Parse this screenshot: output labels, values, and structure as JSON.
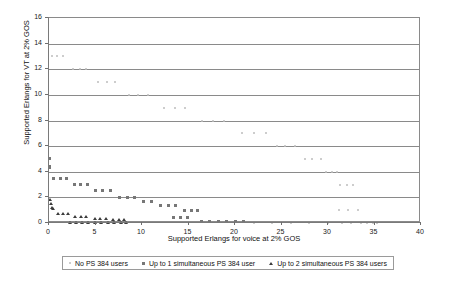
{
  "chart_data": {
    "type": "scatter",
    "title": "",
    "xlabel": "Supported Erlangs for voice at 2% GOS",
    "ylabel": "Supported Erlangs for VT at 2% GOS",
    "xlim": [
      0,
      40
    ],
    "ylim": [
      0,
      16
    ],
    "xticks": [
      0,
      5,
      10,
      15,
      20,
      25,
      30,
      35,
      40
    ],
    "yticks": [
      0,
      2,
      4,
      6,
      8,
      10,
      12,
      14,
      16
    ],
    "grid": "horizontal",
    "legend_position": "bottom",
    "series": [
      {
        "name": "No PS 384 users",
        "marker": "dot",
        "color": "#bdbdbd",
        "points": [
          [
            0.3,
            13.0
          ],
          [
            0.9,
            13.0
          ],
          [
            1.5,
            13.0
          ],
          [
            2.6,
            12.0
          ],
          [
            3.3,
            12.0
          ],
          [
            4.0,
            12.0
          ],
          [
            5.3,
            11.0
          ],
          [
            6.2,
            11.0
          ],
          [
            7.1,
            11.0
          ],
          [
            8.6,
            10.0
          ],
          [
            9.6,
            10.0
          ],
          [
            10.6,
            10.0
          ],
          [
            12.4,
            9.0
          ],
          [
            13.5,
            9.0
          ],
          [
            14.6,
            9.0
          ],
          [
            16.4,
            8.0
          ],
          [
            17.6,
            8.0
          ],
          [
            18.8,
            8.0
          ],
          [
            20.7,
            7.0
          ],
          [
            22.0,
            7.0
          ],
          [
            23.3,
            7.0
          ],
          [
            24.5,
            6.0
          ],
          [
            25.4,
            6.0
          ],
          [
            26.4,
            6.0
          ],
          [
            27.5,
            5.0
          ],
          [
            28.3,
            5.0
          ],
          [
            29.2,
            5.0
          ],
          [
            29.8,
            4.0
          ],
          [
            30.4,
            4.0
          ],
          [
            31.0,
            4.0
          ],
          [
            31.3,
            3.0
          ],
          [
            32.0,
            3.0
          ],
          [
            32.7,
            3.0
          ],
          [
            31.2,
            1.0
          ],
          [
            32.2,
            1.0
          ],
          [
            33.2,
            1.0
          ],
          [
            22.0,
            0.0
          ],
          [
            24.0,
            0.0
          ],
          [
            26.0,
            0.0
          ],
          [
            28.0,
            0.0
          ],
          [
            30.0,
            0.0
          ],
          [
            31.5,
            0.0
          ],
          [
            32.5,
            0.0
          ],
          [
            33.5,
            0.0
          ],
          [
            34.2,
            0.0
          ],
          [
            34.8,
            0.0
          ],
          [
            35.3,
            0.0
          ]
        ]
      },
      {
        "name": "Up to 1 simultaneous PS 384 user",
        "marker": "square",
        "color": "#777777",
        "points": [
          [
            0.1,
            5.0
          ],
          [
            0.1,
            4.4
          ],
          [
            0.1,
            4.3
          ],
          [
            0.5,
            3.5
          ],
          [
            1.2,
            3.5
          ],
          [
            1.9,
            3.5
          ],
          [
            2.7,
            3.0
          ],
          [
            3.4,
            3.0
          ],
          [
            4.1,
            3.0
          ],
          [
            5.0,
            2.5
          ],
          [
            5.8,
            2.5
          ],
          [
            6.6,
            2.5
          ],
          [
            7.6,
            2.0
          ],
          [
            8.4,
            2.0
          ],
          [
            9.2,
            2.0
          ],
          [
            10.2,
            1.7
          ],
          [
            11.0,
            1.7
          ],
          [
            12.0,
            1.4
          ],
          [
            12.8,
            1.4
          ],
          [
            13.6,
            1.4
          ],
          [
            14.6,
            1.0
          ],
          [
            15.3,
            1.0
          ],
          [
            16.0,
            1.0
          ],
          [
            13.4,
            0.4
          ],
          [
            14.1,
            0.4
          ],
          [
            14.9,
            0.4
          ],
          [
            16.4,
            0.1
          ],
          [
            17.3,
            0.1
          ],
          [
            18.2,
            0.1
          ],
          [
            19.1,
            0.1
          ],
          [
            20.0,
            0.1
          ],
          [
            20.9,
            0.1
          ]
        ]
      },
      {
        "name": "Up to 2 simultaneous PS 384 users",
        "marker": "triangle",
        "color": "#3b3b3b",
        "points": [
          [
            0.1,
            1.8
          ],
          [
            0.2,
            1.5
          ],
          [
            0.3,
            1.2
          ],
          [
            0.4,
            1.1
          ],
          [
            1.0,
            0.7
          ],
          [
            1.5,
            0.7
          ],
          [
            2.0,
            0.7
          ],
          [
            2.8,
            0.5
          ],
          [
            3.4,
            0.5
          ],
          [
            4.0,
            0.5
          ],
          [
            4.9,
            0.3
          ],
          [
            5.5,
            0.3
          ],
          [
            6.1,
            0.3
          ],
          [
            6.9,
            0.2
          ],
          [
            7.5,
            0.2
          ],
          [
            8.1,
            0.2
          ],
          [
            2.3,
            0.0
          ],
          [
            2.9,
            0.0
          ],
          [
            3.5,
            0.0
          ],
          [
            4.2,
            0.0
          ],
          [
            4.9,
            0.0
          ],
          [
            5.6,
            0.0
          ],
          [
            6.3,
            0.0
          ],
          [
            7.0,
            0.0
          ],
          [
            7.7,
            0.0
          ],
          [
            8.3,
            0.0
          ]
        ]
      }
    ]
  },
  "legend": {
    "items": [
      {
        "label": "No PS 384 users",
        "marker": "dot-marker"
      },
      {
        "label": "Up to 1 simultaneous PS 384 user",
        "marker": "square-marker"
      },
      {
        "label": "Up to 2 simultaneous PS 384 users",
        "marker": "triangle-marker"
      }
    ]
  }
}
